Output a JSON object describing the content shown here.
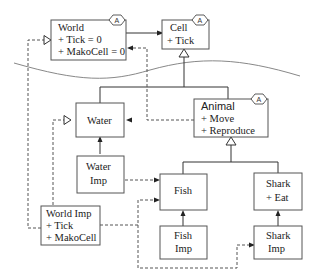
{
  "diagram": {
    "type": "uml-class-diagram",
    "abstract_marker": "A",
    "classes": {
      "world": {
        "name": "World",
        "members": [
          "+ Tick = 0",
          "+ MakoCell = 0"
        ],
        "abstract": true
      },
      "cell": {
        "name": "Cell",
        "members": [
          "+ Tick"
        ],
        "abstract": true
      },
      "water": {
        "name": "Water",
        "members": []
      },
      "animal": {
        "name": "Animal",
        "members": [
          "+ Move",
          "+ Reproduce"
        ],
        "abstract": true
      },
      "water_imp": {
        "name": "Water",
        "name2": "Imp"
      },
      "fish": {
        "name": "Fish"
      },
      "shark": {
        "name": "Shark",
        "members": [
          "+ Eat"
        ]
      },
      "world_imp": {
        "name": "World Imp",
        "members": [
          "+ Tick",
          "+ MakoCell"
        ]
      },
      "fish_imp": {
        "name": "Fish",
        "name2": "Imp"
      },
      "shark_imp": {
        "name": "Shark",
        "name2": "Imp"
      }
    },
    "relations": [
      {
        "from": "World",
        "to": "Cell",
        "kind": "association"
      },
      {
        "from": "Water",
        "to": "Cell",
        "kind": "generalization"
      },
      {
        "from": "Animal",
        "to": "Cell",
        "kind": "generalization"
      },
      {
        "from": "Fish",
        "to": "Animal",
        "kind": "generalization"
      },
      {
        "from": "Shark",
        "to": "Animal",
        "kind": "generalization"
      },
      {
        "from": "Water Imp",
        "to": "Water",
        "kind": "association"
      },
      {
        "from": "Fish Imp",
        "to": "Fish",
        "kind": "association"
      },
      {
        "from": "Shark Imp",
        "to": "Shark",
        "kind": "association"
      },
      {
        "from": "World Imp",
        "to": "World",
        "kind": "realization"
      },
      {
        "from": "World Imp",
        "to": "Water",
        "kind": "realization"
      },
      {
        "from": "Animal",
        "to": "Water",
        "kind": "dependency"
      },
      {
        "from": "Animal",
        "to": "World",
        "kind": "dependency"
      },
      {
        "from": "Water Imp",
        "to": "Fish",
        "kind": "dependency"
      },
      {
        "from": "World Imp",
        "to": "Fish",
        "kind": "dependency"
      },
      {
        "from": "World Imp",
        "to": "Shark Imp",
        "kind": "dependency"
      }
    ]
  }
}
